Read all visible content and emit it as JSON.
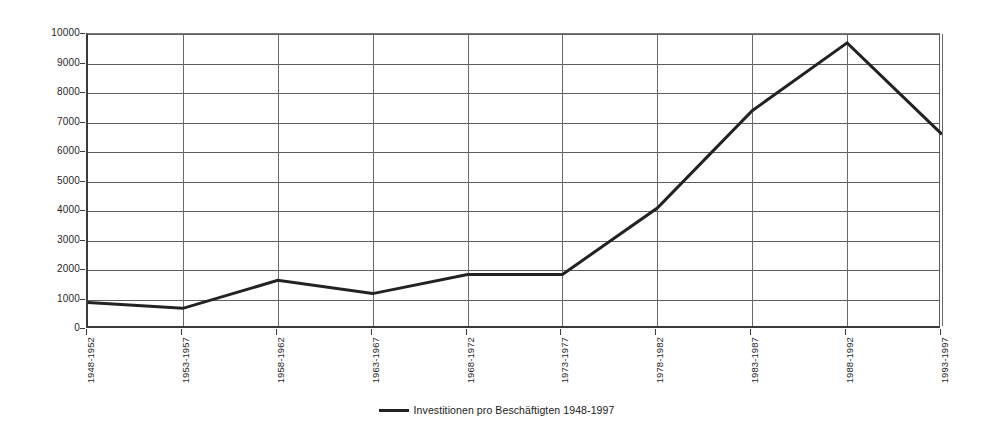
{
  "chart_data": {
    "type": "line",
    "title": "",
    "subtitle": "",
    "xlabel": "",
    "ylabel": "",
    "categories": [
      "1948-1952",
      "1953-1957",
      "1958-1962",
      "1963-1967",
      "1968-1972",
      "1973-1977",
      "1978-1982",
      "1983-1987",
      "1988-1992",
      "1993-1997"
    ],
    "series": [
      {
        "name": "Investitionen pro Beschäftigten 1948-1997",
        "color": "#222222",
        "values": [
          900,
          700,
          1650,
          1200,
          1850,
          1850,
          4100,
          7400,
          9700,
          6600
        ]
      }
    ],
    "ylim": [
      0,
      10000
    ],
    "yticks": [
      0,
      1000,
      2000,
      3000,
      4000,
      5000,
      6000,
      7000,
      8000,
      9000,
      10000
    ],
    "ytick_labels": [
      "0",
      "1000",
      "2000",
      "3000",
      "4000",
      "5000",
      "6000",
      "7000",
      "8000",
      "9000",
      "10000"
    ],
    "grid": {
      "horizontal": true,
      "vertical": true
    },
    "legend": {
      "position": "bottom-center",
      "entries": [
        {
          "label": "Investitionen pro Beschäftigten 1948-1997",
          "color": "#222222",
          "marker": "line"
        }
      ]
    }
  }
}
